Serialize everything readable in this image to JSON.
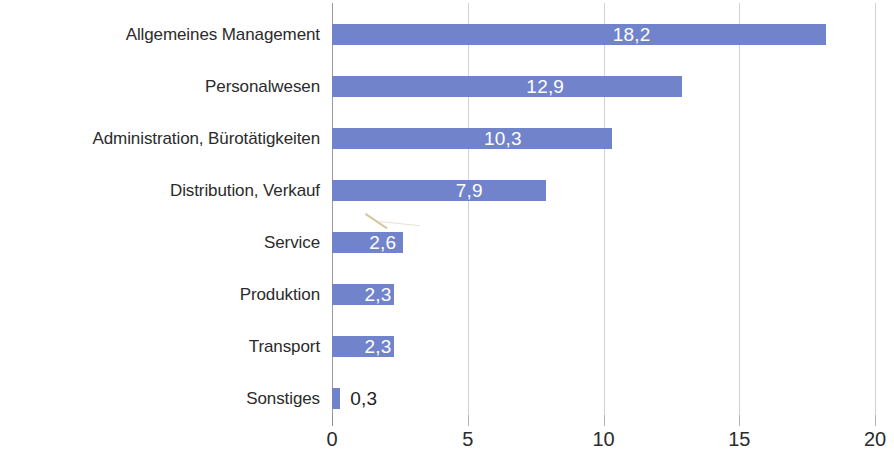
{
  "chart_data": {
    "type": "bar",
    "orientation": "horizontal",
    "title": "",
    "subtitle": "",
    "xlabel": "",
    "ylabel": "",
    "xlim": [
      0,
      20
    ],
    "xticks": [
      "0",
      "5",
      "10",
      "15",
      "20"
    ],
    "xtick_values": [
      0,
      5,
      10,
      15,
      20
    ],
    "grid": "vertical",
    "legend": "none",
    "decimal_separator": ",",
    "bar_color": "#7183cb",
    "label_color_inside": "#ffffff",
    "label_color_outside": "#1d1d1d",
    "gridline_color": "#d2d2d2",
    "axis_color": "#9a9a9a",
    "categories": [
      "Allgemeines Management",
      "Personalwesen",
      "Administration, Bürotätigkeiten",
      "Distribution, Verkauf",
      "Service",
      "Produktion",
      "Transport",
      "Sonstiges"
    ],
    "values": [
      18.2,
      12.9,
      10.3,
      7.9,
      2.6,
      2.3,
      2.3,
      0.3
    ],
    "value_labels": [
      "18,2",
      "12,9",
      "10,3",
      "7,9",
      "2,6",
      "2,3",
      "2,3",
      "0,3"
    ],
    "label_placement": [
      "inside",
      "inside",
      "inside",
      "inside",
      "inside",
      "inside",
      "inside",
      "outside"
    ],
    "series": [
      {
        "name": "",
        "values": [
          18.2,
          12.9,
          10.3,
          7.9,
          2.6,
          2.3,
          2.3,
          0.3
        ]
      }
    ]
  }
}
